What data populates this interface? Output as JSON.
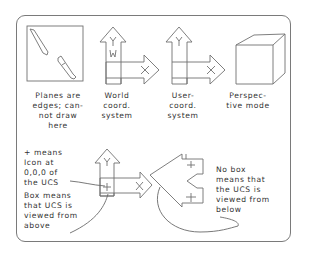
{
  "diagram": {
    "panels": [
      {
        "id": "edge-view",
        "caption": "Planes are\nedges; can-\nnot draw\nhere",
        "icon": "broken-pencil-icon"
      },
      {
        "id": "world",
        "caption": "World\ncoord.\nsystem",
        "icon": "ucs-world-icon",
        "labels": {
          "y": "Y",
          "w": "W",
          "x": "X"
        }
      },
      {
        "id": "user",
        "caption": "User-\ncoord.\nsystem",
        "icon": "ucs-user-icon",
        "labels": {
          "y": "Y",
          "x": "X"
        }
      },
      {
        "id": "perspective",
        "caption": "Perspec-\ntive mode",
        "icon": "perspective-cube-icon"
      }
    ],
    "notes": {
      "plus": "+ means\nIcon at\n0,0,0 of\nthe UCS",
      "box": "Box means\nthat UCS is\nviewed from\nabove",
      "nobox": "No box\nmeans that\nthe UCS is\nviewed from\nbelow"
    },
    "colors": {
      "line": "#6e6e6e",
      "text": "#333333",
      "frame": "#7a7a7a"
    }
  }
}
